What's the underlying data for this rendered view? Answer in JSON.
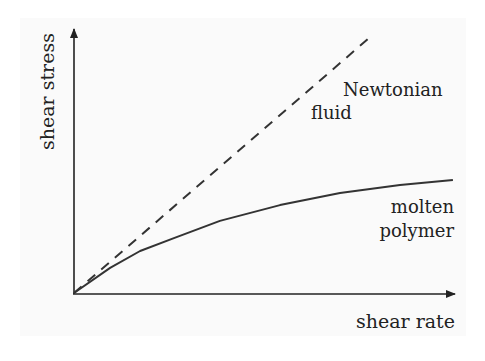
{
  "chart_data": {
    "type": "line",
    "title": "",
    "xlabel": "shear rate",
    "ylabel": "shear stress",
    "grid": false,
    "ticks": false,
    "axis_range_normalized": {
      "x": [
        0,
        1
      ],
      "y": [
        0,
        1
      ]
    },
    "series": [
      {
        "name": "Newtonian fluid",
        "style": "dashed",
        "label_lines": [
          "Newtonian",
          "fluid"
        ],
        "x": [
          0,
          0.78
        ],
        "y": [
          0,
          0.97
        ]
      },
      {
        "name": "molten polymer",
        "style": "solid",
        "label_lines": [
          "molten",
          "polymer"
        ],
        "x": [
          0,
          0.095,
          0.174,
          0.263,
          0.384,
          0.542,
          0.7,
          0.858,
          0.997
        ],
        "y": [
          0,
          0.095,
          0.159,
          0.208,
          0.273,
          0.333,
          0.379,
          0.409,
          0.428
        ]
      }
    ]
  },
  "labels": {
    "ylabel": "shear stress",
    "xlabel": "shear rate",
    "newtonian_line1": "Newtonian",
    "newtonian_line2": "fluid",
    "polymer_line1": "molten",
    "polymer_line2": "polymer"
  },
  "colors": {
    "ink": "#222222",
    "line": "#333333",
    "background": "#fafafa"
  }
}
